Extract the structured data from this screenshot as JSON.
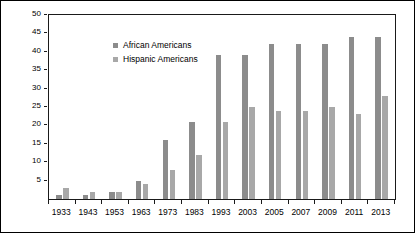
{
  "chart_data": {
    "type": "bar",
    "title": "",
    "xlabel": "",
    "ylabel": "Number of members",
    "ylim": [
      0,
      50
    ],
    "yticks": [
      5,
      10,
      15,
      20,
      25,
      30,
      35,
      40,
      45,
      50
    ],
    "grid": false,
    "legend_position": "top-left",
    "categories": [
      "1933",
      "1943",
      "1953",
      "1963",
      "1973",
      "1983",
      "1993",
      "2003",
      "2005",
      "2007",
      "2009",
      "2011",
      "2013"
    ],
    "series": [
      {
        "name": "African Americans",
        "color": "#8c8c8c",
        "values": [
          1,
          1,
          2,
          5,
          16,
          21,
          39,
          39,
          42,
          42,
          42,
          44,
          44
        ]
      },
      {
        "name": "Hispanic Americans",
        "color": "#a8a8a8",
        "values": [
          3,
          2,
          2,
          4,
          8,
          12,
          21,
          25,
          24,
          24,
          25,
          23,
          28
        ]
      }
    ]
  }
}
